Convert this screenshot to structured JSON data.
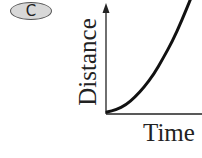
{
  "badge": {
    "label": "C"
  },
  "chart_data": {
    "type": "line",
    "title": "",
    "xlabel": "Time",
    "ylabel": "Distance",
    "grid": false,
    "legend": null,
    "x_ticks": [],
    "y_ticks": [],
    "series": [
      {
        "name": "distance-vs-time",
        "shape": "concave-up curve (accelerating)",
        "x": [
          0,
          0.1,
          0.2,
          0.3,
          0.4,
          0.5,
          0.6,
          0.7,
          0.8,
          0.9
        ],
        "y": [
          0,
          0.02,
          0.06,
          0.13,
          0.22,
          0.33,
          0.47,
          0.62,
          0.8,
          1.0
        ]
      }
    ],
    "colors": {
      "curve": "#111111",
      "axes": "#222222"
    }
  }
}
